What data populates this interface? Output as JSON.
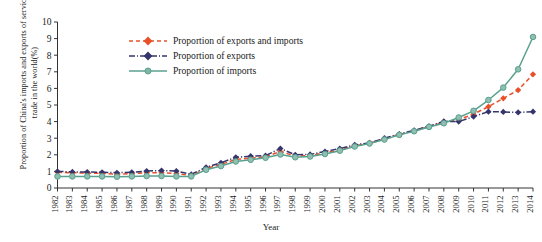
{
  "chart_data": {
    "type": "line",
    "title": "",
    "xlabel": "Year",
    "ylabel": "Proportion of China's imports and exports of service trade in the world(%)",
    "xlim": [
      1982,
      2014
    ],
    "ylim": [
      0,
      10
    ],
    "ytick_step": 1,
    "grid": false,
    "legend_position": "upper-left-inside",
    "x": [
      1982,
      1983,
      1984,
      1985,
      1986,
      1987,
      1988,
      1989,
      1990,
      1991,
      1992,
      1993,
      1994,
      1995,
      1996,
      1997,
      1998,
      1999,
      2000,
      2001,
      2002,
      2003,
      2004,
      2005,
      2006,
      2007,
      2008,
      2009,
      2010,
      2011,
      2012,
      2013,
      2014
    ],
    "xtick_labels": [
      "1982",
      "1983",
      "1984",
      "1985",
      "1986",
      "1987",
      "1988",
      "1989",
      "1990",
      "1991",
      "1992",
      "1993",
      "1994",
      "1995",
      "1996",
      "1997",
      "1998",
      "1999",
      "2000",
      "2001",
      "2002",
      "2003",
      "2004",
      "2005",
      "2006",
      "2007",
      "2008",
      "2009",
      "2010",
      "2011",
      "2012",
      "2013",
      "2014"
    ],
    "ytick_labels": [
      "0",
      "1",
      "2",
      "3",
      "4",
      "5",
      "6",
      "7",
      "8",
      "9",
      "10"
    ],
    "series": [
      {
        "name": "Proportion of exports and imports",
        "color": "#e8502a",
        "marker": "diamond",
        "linestyle": "dashed",
        "values": [
          0.95,
          0.92,
          0.9,
          0.88,
          0.83,
          0.86,
          0.92,
          0.92,
          0.88,
          0.74,
          1.18,
          1.42,
          1.72,
          1.8,
          1.88,
          2.2,
          1.92,
          1.95,
          2.12,
          2.3,
          2.55,
          2.7,
          2.95,
          3.22,
          3.45,
          3.7,
          3.95,
          4.12,
          4.45,
          4.9,
          5.4,
          5.9,
          6.85
        ]
      },
      {
        "name": "Proportion of exports",
        "color": "#36356b",
        "marker": "diamond",
        "linestyle": "dashdot",
        "values": [
          1.0,
          0.97,
          0.96,
          0.95,
          0.92,
          0.95,
          1.02,
          1.05,
          1.02,
          0.82,
          1.25,
          1.52,
          1.85,
          1.92,
          1.95,
          2.38,
          2.0,
          2.02,
          2.2,
          2.38,
          2.6,
          2.72,
          3.0,
          3.25,
          3.48,
          3.72,
          4.02,
          4.0,
          4.3,
          4.6,
          4.58,
          4.55,
          4.6
        ]
      },
      {
        "name": "Proportion of imports",
        "color": "#5aa08e",
        "marker": "circle",
        "linestyle": "solid",
        "values": [
          0.7,
          0.7,
          0.7,
          0.7,
          0.68,
          0.7,
          0.72,
          0.72,
          0.7,
          0.7,
          1.1,
          1.32,
          1.6,
          1.7,
          1.82,
          2.02,
          1.85,
          1.9,
          2.05,
          2.25,
          2.5,
          2.68,
          2.92,
          3.2,
          3.42,
          3.68,
          3.9,
          4.25,
          4.65,
          5.3,
          6.05,
          7.15,
          9.1
        ]
      }
    ]
  },
  "legend": {
    "items": [
      {
        "label": "Proportion of exports and imports"
      },
      {
        "label": "Proportion of exports"
      },
      {
        "label": "Proportion of imports"
      }
    ]
  },
  "axes": {
    "ylabel": "Proportion of China's imports and exports of service trade in the world(%)",
    "xlabel": "Year"
  }
}
